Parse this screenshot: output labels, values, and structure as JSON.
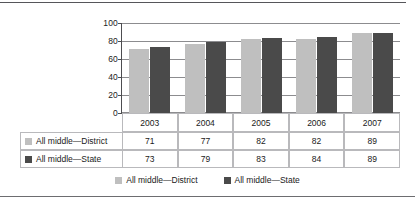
{
  "chart_data": {
    "type": "bar",
    "title": "",
    "subtitle": "",
    "xlabel": "",
    "ylabel": "",
    "categories": [
      "2003",
      "2004",
      "2005",
      "2006",
      "2007"
    ],
    "series": [
      {
        "name": "All middle—District",
        "color": "#bfbfbf",
        "values": [
          71,
          77,
          82,
          82,
          89
        ]
      },
      {
        "name": "All middle—State",
        "color": "#4a4a4a",
        "values": [
          73,
          79,
          83,
          84,
          89
        ]
      }
    ],
    "ylim": [
      0,
      100
    ],
    "yticks": [
      "0",
      "20",
      "40",
      "60",
      "80",
      "100"
    ],
    "ytick_values": [
      0,
      20,
      40,
      60,
      80,
      100
    ],
    "grid": true,
    "legend_position": "bottom",
    "data_table": {
      "visible": true,
      "header_row": [
        "2003",
        "2004",
        "2005",
        "2006",
        "2007"
      ],
      "rows": [
        {
          "label": "All middle—District",
          "swatch": "#bfbfbf",
          "values": [
            "71",
            "77",
            "82",
            "82",
            "89"
          ]
        },
        {
          "label": "All middle—State",
          "swatch": "#4a4a4a",
          "values": [
            "73",
            "79",
            "83",
            "84",
            "89"
          ]
        }
      ]
    }
  },
  "legend": {
    "items": [
      {
        "label": "All middle—District",
        "color": "#bfbfbf"
      },
      {
        "label": "All middle—State",
        "color": "#4a4a4a"
      }
    ]
  },
  "colors": {
    "district": "#bfbfbf",
    "state": "#4a4a4a",
    "grid": "#8c8c8f",
    "axis": "#4d4d50",
    "table_border": "#b9b9bc",
    "frame_rule": "#56565a"
  }
}
